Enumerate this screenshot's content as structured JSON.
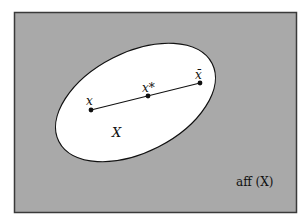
{
  "diagram": {
    "type": "convex-set-in-affine-hull",
    "colors": {
      "background": "#a9a9a9",
      "border": "#3a3a3a",
      "set_fill": "#ffffff",
      "stroke": "#111111"
    },
    "labels": {
      "set": "X",
      "point_left": "x",
      "point_mid": "x*",
      "point_right": "x̄",
      "affine_hull": "aff (X)"
    },
    "points": [
      {
        "name": "x",
        "cx": 91,
        "cy": 110
      },
      {
        "name": "x*",
        "cx": 148,
        "cy": 96
      },
      {
        "name": "x̄",
        "cx": 200,
        "cy": 83
      }
    ]
  }
}
